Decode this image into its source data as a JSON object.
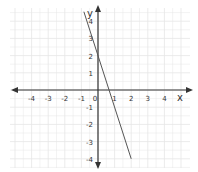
{
  "chart_data": {
    "type": "line",
    "title": "",
    "xlabel": "x",
    "ylabel": "y",
    "xlim": [
      -5,
      5
    ],
    "ylim": [
      -4,
      4
    ],
    "grid": true,
    "x_ticks": [
      "-4",
      "-3",
      "-2",
      "-1",
      "0",
      "1",
      "2",
      "3",
      "4"
    ],
    "y_ticks": [
      "4",
      "3",
      "2",
      "1",
      "-1",
      "-2",
      "-3",
      "-4"
    ],
    "series": [
      {
        "name": "line",
        "equation": "y = -3x + 2",
        "x": [
          -0.85,
          2
        ],
        "y": [
          4.55,
          -4
        ]
      }
    ],
    "colors": {
      "line": "#555555",
      "axis": "#333333",
      "grid": "#e6e6e6"
    }
  }
}
